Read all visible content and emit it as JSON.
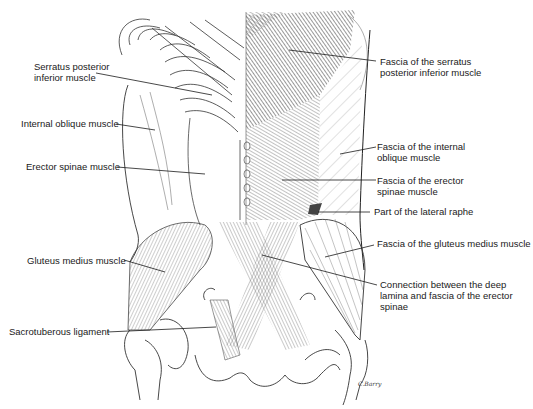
{
  "figure": {
    "width": 533,
    "height": 409,
    "colors": {
      "ink": "#1a1a1a",
      "hatch_dark": "#555555",
      "hatch_light": "#8a8a8a",
      "background": "#ffffff"
    },
    "signature": "C.Barry"
  },
  "labels_left": [
    {
      "id": "serratus-posterior-inferior",
      "text": "Serratus posterior\ninferior muscle",
      "x": 34,
      "y": 61,
      "line": [
        [
          96,
          73
        ],
        [
          212,
          95
        ]
      ]
    },
    {
      "id": "internal-oblique",
      "text": "Internal oblique muscle",
      "x": 21,
      "y": 118,
      "line": [
        [
          116,
          124
        ],
        [
          155,
          130
        ]
      ]
    },
    {
      "id": "erector-spinae",
      "text": "Erector spinae muscle",
      "x": 26,
      "y": 161,
      "line": [
        [
          117,
          167
        ],
        [
          205,
          174
        ]
      ]
    },
    {
      "id": "gluteus-medius",
      "text": "Gluteus medius muscle",
      "x": 27,
      "y": 255,
      "line": [
        [
          124,
          260
        ],
        [
          165,
          272
        ]
      ]
    },
    {
      "id": "sacrotuberous-ligament",
      "text": "Sacrotuberous ligament",
      "x": 9,
      "y": 326,
      "line": [
        [
          107,
          332
        ],
        [
          216,
          327
        ]
      ]
    }
  ],
  "labels_right": [
    {
      "id": "fascia-serratus",
      "text": "Fascia of the serratus\nposterior inferior muscle",
      "x": 380,
      "y": 56,
      "line": [
        [
          289,
          50
        ],
        [
          376,
          61
        ]
      ]
    },
    {
      "id": "fascia-internal-oblique",
      "text": "Fascia of the internal\noblique muscle",
      "x": 377,
      "y": 141,
      "line": [
        [
          340,
          154
        ],
        [
          376,
          147
        ]
      ]
    },
    {
      "id": "fascia-erector-spinae",
      "text": "Fascia of the erector\nspinae muscle",
      "x": 377,
      "y": 175,
      "line": [
        [
          282,
          180
        ],
        [
          376,
          180
        ]
      ]
    },
    {
      "id": "lateral-raphe",
      "text": "Part of the lateral raphe",
      "x": 374,
      "y": 206,
      "line": [
        [
          318,
          212
        ],
        [
          370,
          212
        ]
      ]
    },
    {
      "id": "fascia-gluteus-medius",
      "text": "Fascia of the gluteus medius muscle",
      "x": 377,
      "y": 238,
      "line": [
        [
          325,
          257
        ],
        [
          374,
          245
        ]
      ]
    },
    {
      "id": "deep-lamina-connection",
      "text": "Connection between the deep\nlamina and fascia of the erector\nspinae",
      "x": 380,
      "y": 279,
      "line": [
        [
          262,
          255
        ],
        [
          377,
          285
        ]
      ]
    }
  ]
}
